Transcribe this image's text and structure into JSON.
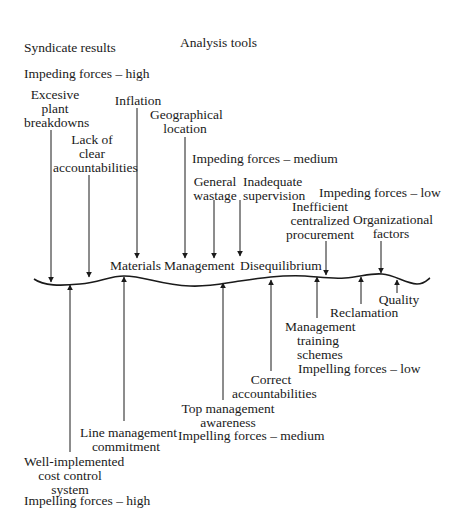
{
  "title": "Analysis tools",
  "subtitle": "Syndicate results",
  "equilibrium_labels": [
    "Materials",
    "Management",
    "Disequilibrium"
  ],
  "groups": {
    "impeding_high": "Impeding forces – high",
    "impeding_medium": "Impeding forces – medium",
    "impeding_low": "Impeding forces – low",
    "impelling_high": "Impelling forces – high",
    "impelling_medium": "Impelling forces – medium",
    "impelling_low": "Impelling forces – low"
  },
  "impeding_forces": [
    {
      "lines": [
        "Excesive",
        "plant",
        "breakdowns"
      ],
      "level": "high"
    },
    {
      "lines": [
        "Lack of",
        "clear",
        "accountabilities"
      ],
      "level": "high"
    },
    {
      "lines": [
        "Inflation"
      ],
      "level": "high"
    },
    {
      "lines": [
        "Geographical",
        "location"
      ],
      "level": "high"
    },
    {
      "lines": [
        "General",
        "wastage"
      ],
      "level": "medium"
    },
    {
      "lines": [
        "Inadequate",
        "supervision"
      ],
      "level": "medium"
    },
    {
      "lines": [
        "Inefficient",
        "centralized",
        "procurement"
      ],
      "level": "low"
    },
    {
      "lines": [
        "Organizational",
        "factors"
      ],
      "level": "low"
    }
  ],
  "impelling_forces": [
    {
      "lines": [
        "Well-implemented",
        "cost control",
        "system"
      ],
      "level": "high"
    },
    {
      "lines": [
        "Line management",
        "commitment"
      ],
      "level": "high"
    },
    {
      "lines": [
        "Top  management",
        "awareness"
      ],
      "level": "medium"
    },
    {
      "lines": [
        "Correct",
        "accountabilities"
      ],
      "level": "medium"
    },
    {
      "lines": [
        "Management",
        "training",
        "schemes"
      ],
      "level": "low"
    },
    {
      "lines": [
        "Reclamation"
      ],
      "level": "low"
    },
    {
      "lines": [
        "Quality"
      ],
      "level": "low"
    }
  ],
  "colors": {
    "ink": "#1a1a1a",
    "background": "#ffffff"
  }
}
